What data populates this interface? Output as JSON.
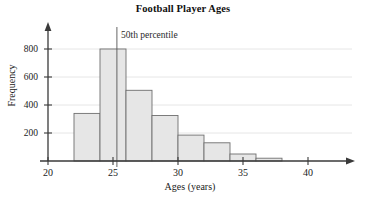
{
  "chart_data": {
    "type": "bar",
    "title": "Football Player Ages",
    "xlabel": "Ages (years)",
    "ylabel": "Frequency",
    "xlim": [
      20,
      43
    ],
    "ylim": [
      0,
      880
    ],
    "grid": true,
    "legend": "none",
    "xticks": [
      20,
      25,
      30,
      35,
      40
    ],
    "xtick_labels": [
      "20",
      "25",
      "30",
      "35",
      "40"
    ],
    "yticks": [
      200,
      400,
      600,
      800
    ],
    "ytick_labels": [
      "200",
      "400",
      "600",
      "800"
    ],
    "bin_width": 2,
    "bin_edges": [
      22,
      24,
      26,
      28,
      30,
      32,
      34,
      36,
      38
    ],
    "categories": [
      "22-24",
      "24-26",
      "26-28",
      "28-30",
      "30-32",
      "32-34",
      "34-36",
      "36-38"
    ],
    "values": [
      340,
      800,
      505,
      325,
      185,
      130,
      50,
      20
    ],
    "annotations": [
      {
        "label": "50th percentile",
        "x": 25.3,
        "type": "vertical-line"
      }
    ]
  },
  "style": {
    "bar_fill": "#e6e6e6",
    "bar_stroke": "#6f6f6f",
    "axis_color": "#3a3a3a",
    "grid_color": "#dcdcdc",
    "text_color": "#1a1a1a"
  }
}
